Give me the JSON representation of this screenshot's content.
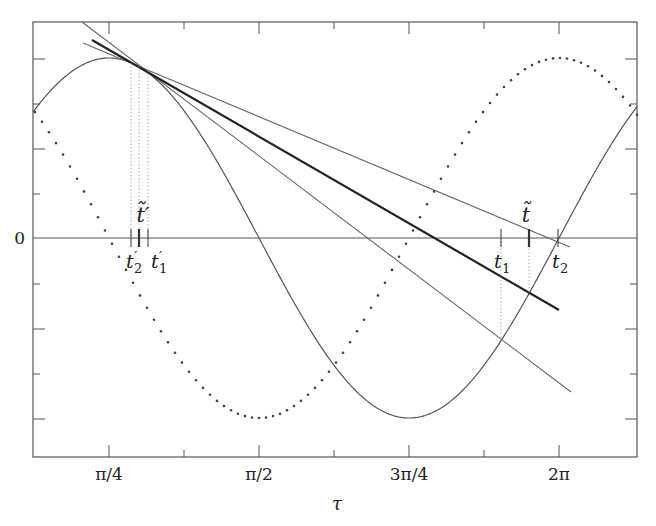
{
  "chart_data": {
    "type": "line",
    "title": "",
    "xlabel": "τ",
    "ylabel": "",
    "x_tick_labels": [
      "π/4",
      "π/2",
      "3π/4",
      "2π"
    ],
    "y_tick_labels": [
      "0"
    ],
    "grid": false,
    "legend": null,
    "series": [
      {
        "name": "solid-curve",
        "style": "solid",
        "description": "cosine-like curve, peak near π/4, zero at π/2, minimum at 3π/4, zero at 2π label"
      },
      {
        "name": "dotted-curve",
        "style": "dotted",
        "description": "phase-shifted curve, minimum at π/2, maximum just right of 2π label"
      },
      {
        "name": "tangent-steep",
        "style": "solid-thin"
      },
      {
        "name": "tangent-shallow",
        "style": "solid-thin"
      },
      {
        "name": "secant-thick",
        "style": "solid-thick"
      }
    ],
    "annotations": {
      "left_marks": [
        "t′₂",
        "t̃′",
        "t′₁"
      ],
      "right_marks": [
        "t₁",
        "t̃",
        "t₂"
      ]
    }
  },
  "labels": {
    "xlabel": "τ",
    "zero": "0",
    "xticks": [
      "π/4",
      "π/2",
      "3π/4",
      "2π"
    ],
    "t_tilde_prime": "t̃′",
    "t2_prime_base": "t",
    "t2_prime_sub": "2",
    "t1_prime_base": "t",
    "t1_prime_sub": "1",
    "prime": "′",
    "t_tilde": "t̃",
    "t1_base": "t",
    "t1_sub": "1",
    "t2_base": "t",
    "t2_sub": "2"
  }
}
